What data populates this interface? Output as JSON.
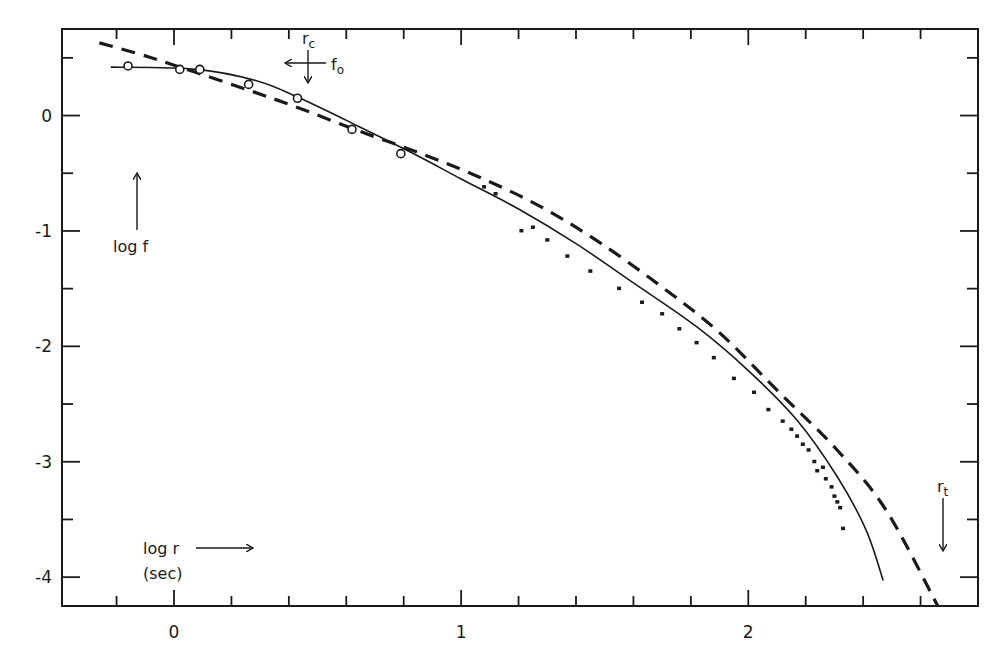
{
  "chart_data": {
    "type": "line",
    "title": "",
    "xlabel": "log r (sec)",
    "ylabel": "log f",
    "xlim": [
      -0.39,
      2.8
    ],
    "ylim": [
      -4.25,
      0.75
    ],
    "x_ticks_major": [
      0,
      1,
      2
    ],
    "x_tick_labels": [
      "0",
      "1",
      "2"
    ],
    "x_ticks_minor_step": 0.2,
    "y_ticks_major": [
      0,
      -1,
      -2,
      -3,
      -4
    ],
    "y_tick_labels": [
      "0",
      "-1",
      "-2",
      "-3",
      "-4"
    ],
    "y_ticks_minor_step": 0.5,
    "grid": false,
    "legend": null,
    "series": [
      {
        "name": "model (solid)",
        "style": "solid",
        "x": [
          -0.22,
          0.08,
          0.29,
          0.43,
          0.64,
          0.85,
          1.0,
          1.2,
          1.4,
          1.6,
          1.82,
          2.0,
          2.17,
          2.31,
          2.41,
          2.47
        ],
        "y": [
          0.42,
          0.4,
          0.3,
          0.16,
          -0.09,
          -0.35,
          -0.55,
          -0.81,
          -1.11,
          -1.45,
          -1.83,
          -2.21,
          -2.64,
          -3.13,
          -3.59,
          -4.03
        ]
      },
      {
        "name": "model (dashed)",
        "style": "dashed",
        "x": [
          -0.26,
          -0.09,
          0.08,
          0.26,
          0.43,
          0.64,
          0.85,
          1.06,
          1.27,
          1.47,
          1.68,
          1.89,
          2.1,
          2.31,
          2.48,
          2.66
        ],
        "y": [
          0.63,
          0.51,
          0.37,
          0.22,
          0.07,
          -0.13,
          -0.32,
          -0.53,
          -0.78,
          -1.08,
          -1.45,
          -1.86,
          -2.38,
          -2.9,
          -3.42,
          -4.25
        ]
      },
      {
        "name": "observations (open circles)",
        "style": "open-circle",
        "x": [
          -0.16,
          0.02,
          0.09,
          0.26,
          0.43,
          0.62,
          0.79
        ],
        "y": [
          0.43,
          0.4,
          0.4,
          0.27,
          0.15,
          -0.12,
          -0.33
        ]
      },
      {
        "name": "observations (dots)",
        "style": "dot",
        "x": [
          1.08,
          1.12,
          1.21,
          1.25,
          1.3,
          1.37,
          1.45,
          1.55,
          1.63,
          1.7,
          1.76,
          1.82,
          1.88,
          1.95,
          2.02,
          2.07,
          2.12,
          2.15,
          2.17,
          2.19,
          2.21,
          2.23,
          2.24,
          2.26,
          2.27,
          2.29,
          2.3,
          2.31,
          2.32,
          2.33
        ],
        "y": [
          -0.62,
          -0.68,
          -1.0,
          -0.97,
          -1.08,
          -1.22,
          -1.35,
          -1.5,
          -1.62,
          -1.72,
          -1.85,
          -1.97,
          -2.1,
          -2.28,
          -2.4,
          -2.55,
          -2.65,
          -2.72,
          -2.78,
          -2.85,
          -2.9,
          -3.0,
          -3.08,
          -3.05,
          -3.15,
          -3.22,
          -3.3,
          -3.35,
          -3.4,
          -3.58
        ]
      }
    ],
    "annotations": [
      {
        "text": "r_c",
        "x": 0.46,
        "y": 0.62
      },
      {
        "text": "f_0",
        "x": 0.52,
        "y": 0.4
      },
      {
        "text": "r_t",
        "x": 2.67,
        "y": -3.25
      },
      {
        "text": "log f",
        "x": -0.17,
        "y": -1.12
      },
      {
        "text": "log r (sec)",
        "x": -0.09,
        "y": -3.95
      }
    ]
  },
  "labels": {
    "x_ticks": [
      "0",
      "1",
      "2"
    ],
    "y_ticks": [
      "0",
      "-1",
      "-2",
      "-3",
      "-4"
    ],
    "log_f": "log f",
    "log_r": "log r",
    "sec": "(sec)",
    "r_c_main": "r",
    "r_c_sub": "c",
    "f_0_main": "f",
    "f_0_sub": "o",
    "r_t_main": "r",
    "r_t_sub": "t"
  },
  "colors": {
    "ink": "#1a1a1a",
    "background": "#ffffff"
  }
}
